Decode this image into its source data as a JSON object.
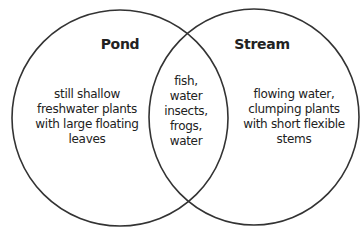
{
  "diagram": {
    "type": "venn",
    "stroke_color": "#333333",
    "background": "#ffffff",
    "sets": [
      {
        "id": "pond",
        "title": "Pond",
        "description": "still shallow\nfreshwater plants\nwith large floating\nleaves"
      },
      {
        "id": "stream",
        "title": "Stream",
        "description": "flowing water,\nclumping plants\nwith short flexible\nstems"
      }
    ],
    "intersection": {
      "description": "fish,\nwater\ninsects,\nfrogs,\nwater"
    }
  }
}
